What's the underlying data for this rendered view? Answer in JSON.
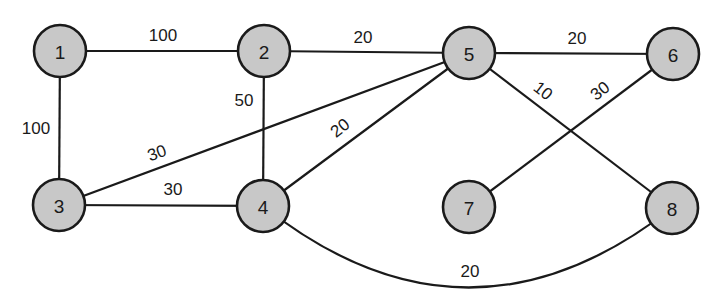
{
  "diagram": {
    "type": "weighted-undirected-graph",
    "node_fill": "#c8c8c8",
    "stroke_color": "#1a1a1a",
    "nodes": [
      {
        "id": "1",
        "label": "1",
        "x": 60,
        "y": 51
      },
      {
        "id": "2",
        "label": "2",
        "x": 264,
        "y": 51
      },
      {
        "id": "3",
        "label": "3",
        "x": 59,
        "y": 205
      },
      {
        "id": "4",
        "label": "4",
        "x": 263,
        "y": 206
      },
      {
        "id": "5",
        "label": "5",
        "x": 469,
        "y": 53
      },
      {
        "id": "6",
        "label": "6",
        "x": 673,
        "y": 54
      },
      {
        "id": "7",
        "label": "7",
        "x": 469,
        "y": 207
      },
      {
        "id": "8",
        "label": "8",
        "x": 672,
        "y": 208
      }
    ],
    "edges": [
      {
        "from": "1",
        "to": "2",
        "weight": "100",
        "label_x": 163,
        "label_y": 35,
        "rotate": 0
      },
      {
        "from": "1",
        "to": "3",
        "weight": "100",
        "label_x": 36,
        "label_y": 128,
        "rotate": 0
      },
      {
        "from": "2",
        "to": "5",
        "weight": "20",
        "label_x": 363,
        "label_y": 37,
        "rotate": 0
      },
      {
        "from": "2",
        "to": "4",
        "weight": "50",
        "label_x": 244,
        "label_y": 100,
        "rotate": 0
      },
      {
        "from": "3",
        "to": "5",
        "weight": "30",
        "label_x": 157,
        "label_y": 153,
        "rotate": -20
      },
      {
        "from": "3",
        "to": "4",
        "weight": "30",
        "label_x": 173,
        "label_y": 189,
        "rotate": 0
      },
      {
        "from": "4",
        "to": "5",
        "weight": "20",
        "label_x": 340,
        "label_y": 128,
        "rotate": -38
      },
      {
        "from": "5",
        "to": "6",
        "weight": "20",
        "label_x": 577,
        "label_y": 38,
        "rotate": 0
      },
      {
        "from": "5",
        "to": "8",
        "weight": "10",
        "label_x": 543,
        "label_y": 91,
        "rotate": 38
      },
      {
        "from": "6",
        "to": "7",
        "weight": "30",
        "label_x": 600,
        "label_y": 91,
        "rotate": -38
      },
      {
        "from": "4",
        "to": "8",
        "weight": "20",
        "label_x": 470,
        "label_y": 271,
        "rotate": 0,
        "curved": true
      }
    ]
  }
}
